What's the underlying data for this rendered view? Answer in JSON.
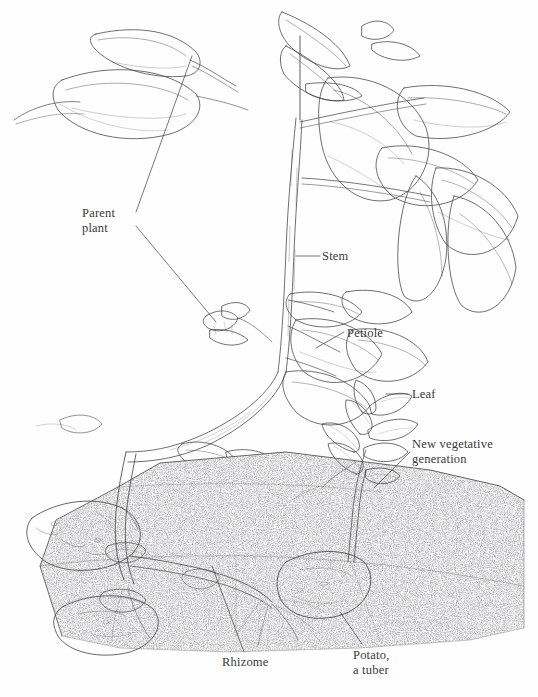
{
  "figure": {
    "technique": "pen-and-ink stipple line drawing",
    "background_color": "#fefefe",
    "ink_color": "#3a3a3a",
    "width": 538,
    "height": 697
  },
  "labels": {
    "parent_plant": "Parent\nplant",
    "stem": "Stem",
    "petiole": "Petiole",
    "leaf": "Leaf",
    "new_vegetative_generation": "New vegetative\ngeneration",
    "rhizome": "Rhizome",
    "potato": "Potato,\na tuber"
  },
  "parts": [
    {
      "name": "parent-plant",
      "label": "Parent plant",
      "leader": "two-branch-v"
    },
    {
      "name": "stem",
      "label": "Stem",
      "leader": "horizontal"
    },
    {
      "name": "petiole",
      "label": "Petiole",
      "leader": "diagonal"
    },
    {
      "name": "leaf",
      "label": "Leaf",
      "leader": "horizontal"
    },
    {
      "name": "new-vegetative-generation",
      "label": "New vegetative generation",
      "leader": "diagonal"
    },
    {
      "name": "rhizome",
      "label": "Rhizome",
      "leader": "vertical"
    },
    {
      "name": "potato-tuber",
      "label": "Potato, a tuber",
      "leader": "diagonal"
    }
  ],
  "scene": {
    "soil_block": "hatched cross-section of soil occupying lower-left through lower-right",
    "tubers_visible": 5,
    "aerial_shoot": "upright leafy stem with compound pinnate leaves at top",
    "new_shoot": "small sprout rising from right-hand tuber through soil surface"
  },
  "signature": {
    "present": true,
    "text": "",
    "note": "illegible handwritten artist signature near lower right of soil block"
  }
}
